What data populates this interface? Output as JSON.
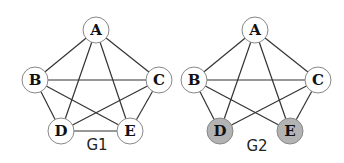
{
  "graphs": [
    {
      "id": "G1",
      "label": "G1",
      "nodes": [
        {
          "id": "A",
          "label": "A",
          "highlighted": false
        },
        {
          "id": "B",
          "label": "B",
          "highlighted": false
        },
        {
          "id": "C",
          "label": "C",
          "highlighted": false
        },
        {
          "id": "D",
          "label": "D",
          "highlighted": false
        },
        {
          "id": "E",
          "label": "E",
          "highlighted": false
        }
      ],
      "edges": [
        [
          "A",
          "B"
        ],
        [
          "A",
          "C"
        ],
        [
          "A",
          "D"
        ],
        [
          "A",
          "E"
        ],
        [
          "B",
          "C"
        ],
        [
          "B",
          "D"
        ],
        [
          "B",
          "E"
        ],
        [
          "C",
          "D"
        ],
        [
          "C",
          "E"
        ],
        [
          "D",
          "E"
        ]
      ]
    },
    {
      "id": "G2",
      "label": "G2",
      "nodes": [
        {
          "id": "A",
          "label": "A",
          "highlighted": false
        },
        {
          "id": "B",
          "label": "B",
          "highlighted": false
        },
        {
          "id": "C",
          "label": "C",
          "highlighted": false
        },
        {
          "id": "D",
          "label": "D",
          "highlighted": true
        },
        {
          "id": "E",
          "label": "E",
          "highlighted": true
        }
      ],
      "edges": [
        [
          "A",
          "B"
        ],
        [
          "A",
          "C"
        ],
        [
          "A",
          "D"
        ],
        [
          "A",
          "E"
        ],
        [
          "B",
          "C"
        ],
        [
          "B",
          "D"
        ],
        [
          "B",
          "E"
        ],
        [
          "C",
          "D"
        ],
        [
          "C",
          "E"
        ]
      ]
    }
  ],
  "colors": {
    "node_fill": "#ffffff",
    "highlight_fill": "#b3b3b3",
    "edge": "#333333"
  }
}
